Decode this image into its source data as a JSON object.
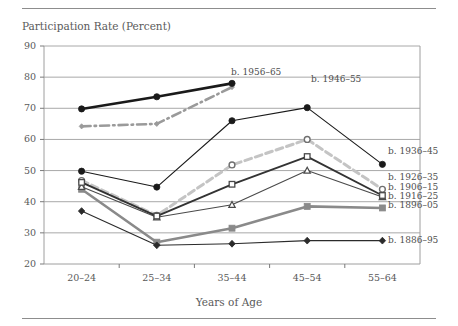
{
  "figure": {
    "title": "Participation Rate (Percent)",
    "xaxis_title": "Years of Age"
  },
  "chart_data": {
    "type": "line",
    "title": "Participation Rate (Percent)",
    "xlabel": "Years of Age",
    "ylabel": "Participation Rate (Percent)",
    "categories": [
      "20–24",
      "25–34",
      "35–44",
      "45–54",
      "55–64"
    ],
    "ylim": [
      20,
      90
    ],
    "yticks": [
      20,
      30,
      40,
      50,
      60,
      70,
      80,
      90
    ],
    "grid": "horizontal",
    "legend_position": "inline-labels",
    "series": [
      {
        "name": "b. 1956–65",
        "label": "b. 1956–65",
        "color": "#1a1a1a",
        "style": "solid-thick",
        "marker": "circle-filled",
        "values": [
          69.8,
          73.7,
          78.0,
          null,
          null
        ],
        "label_anchor": {
          "x": 231,
          "y": 73
        }
      },
      {
        "name": "b. 1946–55",
        "label": "b. 1946–55",
        "color": "#9a9a9a",
        "style": "dash-dot-thick",
        "marker": "diamond-small",
        "values": [
          64.2,
          65.0,
          76.8,
          null,
          null
        ],
        "label_anchor": {
          "x": 311,
          "y": 80
        }
      },
      {
        "name": "b. 1936–45",
        "label": "b. 1936–45",
        "color": "#1a1a1a",
        "style": "solid-thin",
        "marker": "circle-filled",
        "values": [
          49.8,
          44.7,
          66.0,
          70.2,
          52.0
        ],
        "label_anchor": {
          "x": 388,
          "y": 152
        }
      },
      {
        "name": "b. 1926–35",
        "label": "b. 1926–35",
        "color": "#c4c4c4",
        "style": "dashed-thick",
        "marker": "circle-open",
        "values": [
          46.8,
          35.6,
          51.8,
          60.0,
          44.0
        ],
        "label_anchor": {
          "x": 388,
          "y": 178
        }
      },
      {
        "name": "b. 1906–15",
        "label": "b. 1906–15",
        "color": "#333333",
        "style": "solid-medium",
        "marker": "square-open",
        "values": [
          46.2,
          35.4,
          45.6,
          54.5,
          42.0
        ],
        "label_anchor": {
          "x": 388,
          "y": 188
        }
      },
      {
        "name": "b. 1916–25",
        "label": "b. 1916–25",
        "color": "#4a4a4a",
        "style": "solid-thin",
        "marker": "triangle-open",
        "values": [
          44.8,
          35.0,
          39.0,
          50.0,
          41.5
        ],
        "label_anchor": {
          "x": 388,
          "y": 197
        }
      },
      {
        "name": "b. 1896–05",
        "label": "b. 1896–05",
        "color": "#8a8a8a",
        "style": "solid-thick",
        "marker": "square-filled",
        "values": [
          44.0,
          27.0,
          31.5,
          38.5,
          38.0
        ],
        "label_anchor": {
          "x": 388,
          "y": 206
        }
      },
      {
        "name": "b. 1886–95",
        "label": "b. 1886–95",
        "color": "#2b2b2b",
        "style": "solid-thin",
        "marker": "diamond-filled",
        "values": [
          37.0,
          26.0,
          26.5,
          27.5,
          27.5
        ],
        "label_anchor": {
          "x": 388,
          "y": 241
        }
      }
    ]
  }
}
